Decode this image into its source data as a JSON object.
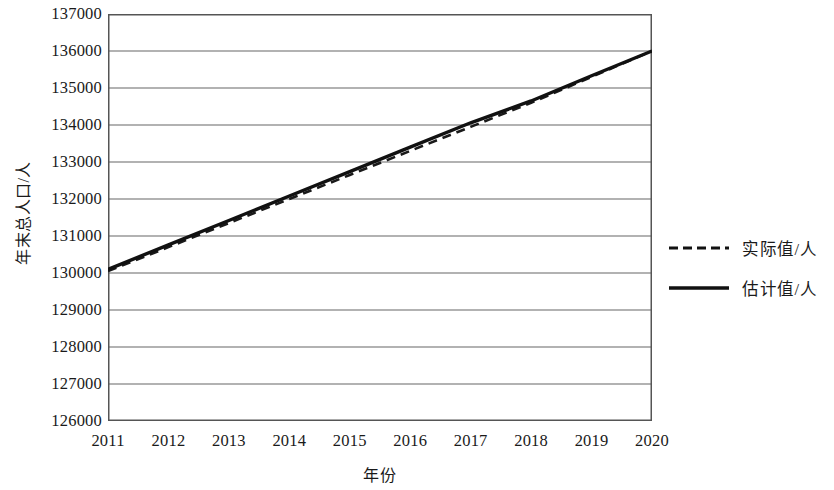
{
  "chart_data": {
    "type": "line",
    "title": "",
    "xlabel": "年份",
    "ylabel": "年末总人口/人",
    "x": [
      2011,
      2012,
      2013,
      2014,
      2015,
      2016,
      2017,
      2018,
      2019,
      2020
    ],
    "xtick_labels": [
      "2011",
      "2012",
      "2013",
      "2014",
      "2015",
      "2016",
      "2017",
      "2018",
      "2019",
      "2020"
    ],
    "ytick_labels": [
      "137000",
      "136000",
      "135000",
      "134000",
      "133000",
      "132000",
      "131000",
      "130000",
      "129000",
      "128000",
      "127000",
      "126000"
    ],
    "ytick_values": [
      137000,
      136000,
      135000,
      134000,
      133000,
      132000,
      131000,
      130000,
      129000,
      128000,
      127000,
      126000
    ],
    "xlim": [
      2011,
      2020
    ],
    "ylim": [
      126000,
      137000
    ],
    "grid": "horizontal",
    "legend_position": "right",
    "series": [
      {
        "name": "实际值/人",
        "style": "dashed",
        "color": "#1a1a1a",
        "values": [
          130050,
          130700,
          131350,
          132000,
          132650,
          133300,
          133950,
          134600,
          135300,
          136000
        ]
      },
      {
        "name": "估计值/人",
        "style": "solid",
        "color": "#111111",
        "values": [
          130100,
          130760,
          131420,
          132080,
          132740,
          133400,
          134060,
          134650,
          135330,
          136000
        ]
      }
    ]
  },
  "legend": {
    "items": [
      {
        "label": "实际值/人",
        "style": "dashed"
      },
      {
        "label": "估计值/人",
        "style": "solid"
      }
    ]
  },
  "colors": {
    "axis": "#555555",
    "grid": "#666666",
    "line": "#111111",
    "text": "#1a1a1a",
    "background": "#ffffff"
  }
}
